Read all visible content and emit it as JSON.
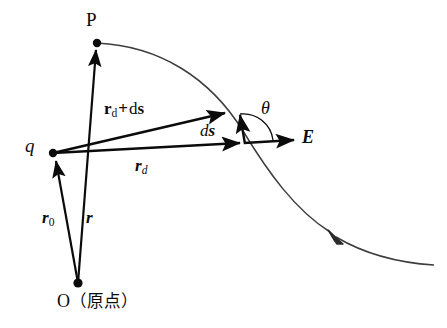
{
  "figure": {
    "background_color": "#ffffff",
    "ink_color": "#0b0b0b",
    "curve_color": "#3d3d3d"
  },
  "labels": {
    "point_p": "P",
    "charge_q": "q",
    "vector_rd_plus_ds_main": "r",
    "vector_rd_plus_ds_sub": "d",
    "vector_rd_plus_ds_plus": "+",
    "vector_rd_plus_ds_tail": "ds",
    "vector_ds_d": "d",
    "vector_ds_s": "s",
    "angle_theta": "θ",
    "field_E": "E",
    "vector_rd_main": "r",
    "vector_rd_sub": "d",
    "vector_r0_main": "r",
    "vector_r0_sub": "0",
    "vector_r": "r",
    "origin_O": "O",
    "origin_paren_open": "（",
    "origin_word": "原点",
    "origin_paren_close": "）"
  },
  "nodes": [
    {
      "name": "point-p",
      "label": "P",
      "x": 97,
      "y": 43
    },
    {
      "name": "charge-q",
      "label": "q",
      "x": 53,
      "y": 153
    },
    {
      "name": "origin-o",
      "label": "O",
      "x": 78,
      "y": 283
    }
  ],
  "vectors": [
    {
      "name": "r-vector",
      "label": "r",
      "from": [
        78,
        283
      ],
      "to": [
        97,
        45
      ]
    },
    {
      "name": "r0-vector",
      "label": "r0",
      "from": [
        78,
        283
      ],
      "to": [
        55,
        157
      ]
    },
    {
      "name": "rd-vector",
      "label": "rd",
      "from": [
        53,
        153
      ],
      "to": [
        245,
        143
      ]
    },
    {
      "name": "rd-plus-ds-vector",
      "label": "rd+ds",
      "from": [
        53,
        153
      ],
      "to": [
        229,
        112
      ]
    },
    {
      "name": "ds-vector",
      "label": "ds",
      "from": [
        244,
        143
      ],
      "to": [
        239,
        110
      ]
    },
    {
      "name": "E-vector",
      "label": "E",
      "from": [
        244,
        143
      ],
      "to": [
        299,
        140
      ]
    }
  ],
  "field_line": {
    "name": "electric-field-line",
    "start": [
      97,
      43
    ],
    "end": [
      434,
      265
    ],
    "arrow_at": [
      333,
      234
    ],
    "arrow_direction": "up-left"
  },
  "angle_arc": {
    "name": "theta-angle-arc",
    "center": [
      244,
      143
    ],
    "radius": 30,
    "between": [
      "ds-vector",
      "E-vector"
    ]
  }
}
